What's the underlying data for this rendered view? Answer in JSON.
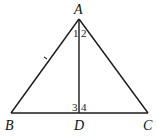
{
  "diagram": {
    "type": "geometry",
    "points": {
      "A": {
        "label": "A"
      },
      "B": {
        "label": "B"
      },
      "C": {
        "label": "C"
      },
      "D": {
        "label": "D"
      }
    },
    "segments": [
      "AB",
      "AC",
      "BC",
      "AD"
    ],
    "angle_labels": [
      "1",
      "2",
      "3",
      "4"
    ],
    "colors": {
      "stroke": "#1a1a1a",
      "text": "#111111"
    }
  }
}
